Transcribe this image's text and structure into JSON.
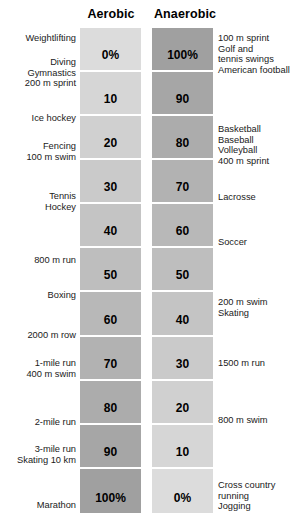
{
  "chart_data": {
    "type": "table",
    "columns": [
      "Aerobic",
      "Anaerobic"
    ],
    "xlabel": "",
    "ylabel": "",
    "grid": false,
    "legend": "none",
    "categories": [
      "Weightlifting / Diving / Gymnastics / 200 m sprint",
      "Ice hockey",
      "Fencing / 100 m swim",
      "Tennis / Hockey",
      "",
      "800 m run / Boxing",
      "2000 m row",
      "1-mile run / 400 m swim",
      "2-mile run",
      "3-mile run / Skating 10 km",
      "Marathon"
    ],
    "series": [
      {
        "name": "Aerobic",
        "values": [
          0,
          10,
          20,
          30,
          40,
          50,
          60,
          70,
          80,
          90,
          100
        ]
      },
      {
        "name": "Anaerobic",
        "values": [
          100,
          90,
          80,
          70,
          60,
          50,
          40,
          30,
          20,
          10,
          0
        ]
      }
    ],
    "ylim": [
      0,
      100
    ]
  },
  "header": {
    "aerobic": "Aerobic",
    "anaerobic": "Anaerobic"
  },
  "rows": [
    {
      "aerobic_value": "0%",
      "anaerobic_value": "100%"
    },
    {
      "aerobic_value": "10",
      "anaerobic_value": "90"
    },
    {
      "aerobic_value": "20",
      "anaerobic_value": "80"
    },
    {
      "aerobic_value": "30",
      "anaerobic_value": "70"
    },
    {
      "aerobic_value": "40",
      "anaerobic_value": "60"
    },
    {
      "aerobic_value": "50",
      "anaerobic_value": "50"
    },
    {
      "aerobic_value": "60",
      "anaerobic_value": "40"
    },
    {
      "aerobic_value": "70",
      "anaerobic_value": "30"
    },
    {
      "aerobic_value": "80",
      "anaerobic_value": "20"
    },
    {
      "aerobic_value": "90",
      "anaerobic_value": "10"
    },
    {
      "aerobic_value": "100%",
      "anaerobic_value": "0%"
    }
  ],
  "left_labels": [
    {
      "text": "Weightlifting",
      "top": 33
    },
    {
      "text": "Diving\nGymnastics\n200 m sprint",
      "top": 57
    },
    {
      "text": "Ice hockey",
      "top": 113
    },
    {
      "text": "Fencing\n100 m swim",
      "top": 141
    },
    {
      "text": "Tennis\nHockey",
      "top": 191
    },
    {
      "text": "800 m run",
      "top": 255
    },
    {
      "text": "Boxing",
      "top": 290
    },
    {
      "text": "2000 m row",
      "top": 330
    },
    {
      "text": "1-mile run\n400 m swim",
      "top": 358
    },
    {
      "text": "2-mile run",
      "top": 417
    },
    {
      "text": "3-mile run\nSkating 10 km",
      "top": 444
    },
    {
      "text": "Marathon",
      "top": 500
    }
  ],
  "right_labels": [
    {
      "text": "100 m sprint\nGolf and\ntennis swings\nAmerican football",
      "top": 33
    },
    {
      "text": "Basketball\nBaseball\nVolleyball\n400 m sprint",
      "top": 124
    },
    {
      "text": "Lacrosse",
      "top": 192
    },
    {
      "text": "Soccer",
      "top": 237
    },
    {
      "text": "200 m swim\nSkating",
      "top": 297
    },
    {
      "text": "1500 m run",
      "top": 358
    },
    {
      "text": "800 m swim",
      "top": 415
    },
    {
      "text": "Cross country\nrunning\nJogging",
      "top": 480
    }
  ],
  "colors": {
    "aerobic_top": "#dcdcdc",
    "aerobic_bottom": "#a0a0a0",
    "anaerobic_top": "#a0a0a0",
    "anaerobic_bottom": "#dcdcdc",
    "separator": "#ffffff",
    "text": "#1a1a1a",
    "background": "#ffffff"
  }
}
